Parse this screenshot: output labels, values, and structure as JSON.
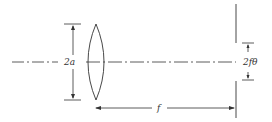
{
  "diagram": {
    "type": "optics-schematic",
    "labels": {
      "aperture": "2a",
      "focal_length": "f",
      "spot_width": "2fθ"
    },
    "elements": [
      "optical-axis",
      "lens",
      "aperture-dimension",
      "focal-length-dimension",
      "screen-with-slit",
      "spot-width-dimension"
    ],
    "colors": {
      "line": "#333333",
      "background": "#ffffff"
    }
  }
}
